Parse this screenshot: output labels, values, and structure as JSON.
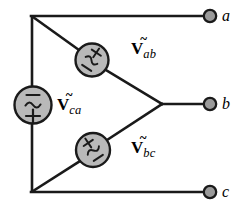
{
  "figure": {
    "colors": {
      "wire": "#1a1a1a",
      "source_fill": "#b9b9b9",
      "source_stroke": "#1a1a1a",
      "terminal_fill": "#9a9a9a",
      "terminal_stroke": "#1a1a1a",
      "background": "#ffffff",
      "text": "#000000"
    },
    "geometry": {
      "top_left_node": [
        32,
        16
      ],
      "bottom_left_node": [
        32,
        192
      ],
      "right_node": [
        163,
        104
      ],
      "terminal_a": [
        210,
        16
      ],
      "terminal_b": [
        210,
        104
      ],
      "terminal_c": [
        210,
        192
      ]
    }
  },
  "sources": [
    {
      "id": "source-ab",
      "label_v": "V",
      "label_tilde": "~",
      "label_sub": "ab",
      "polarity_plus": "+",
      "polarity_minus": "−",
      "waveform": "~",
      "center": [
        92,
        60
      ],
      "diameter": 33,
      "orientation_deg": 34,
      "plus_position": "upper-left",
      "minus_position": "lower-right"
    },
    {
      "id": "source-ca",
      "label_v": "V",
      "label_tilde": "~",
      "label_sub": "ca",
      "polarity_plus": "+",
      "polarity_minus": "−",
      "waveform": "~",
      "center": [
        33,
        105
      ],
      "diameter": 37,
      "orientation_deg": 0,
      "plus_position": "bottom",
      "minus_position": "top"
    },
    {
      "id": "source-bc",
      "label_v": "V",
      "label_tilde": "~",
      "label_sub": "bc",
      "polarity_plus": "+",
      "polarity_minus": "−",
      "waveform": "~",
      "center": [
        93,
        150
      ],
      "diameter": 34,
      "orientation_deg": -34,
      "plus_position": "upper-right",
      "minus_position": "lower-left"
    }
  ],
  "labels": {
    "v_ab": {
      "symbol": "V",
      "tilde": "~",
      "subscript": "ab",
      "x": 131,
      "y": 40
    },
    "v_ca": {
      "symbol": "V",
      "tilde": "~",
      "subscript": "ca",
      "x": 57,
      "y": 96
    },
    "v_bc": {
      "symbol": "V",
      "tilde": "~",
      "subscript": "bc",
      "x": 131,
      "y": 139
    }
  },
  "terminals": [
    {
      "id": "terminal-a",
      "label": "a",
      "x": 210,
      "y": 16,
      "label_x": 222,
      "label_y": 8
    },
    {
      "id": "terminal-b",
      "label": "b",
      "x": 210,
      "y": 104,
      "label_x": 222,
      "label_y": 96
    },
    {
      "id": "terminal-c",
      "label": "c",
      "x": 210,
      "y": 192,
      "label_x": 222,
      "label_y": 184
    }
  ]
}
